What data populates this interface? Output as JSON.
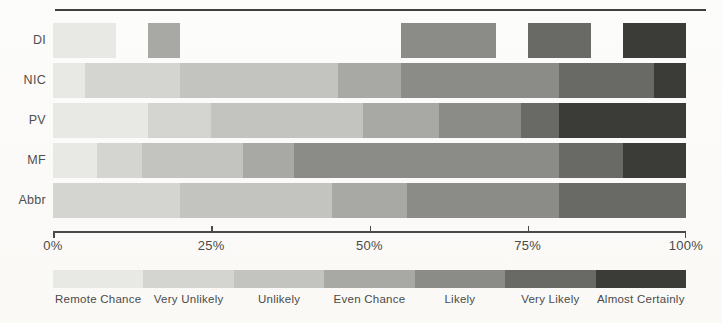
{
  "chart_data": {
    "type": "bar",
    "orientation": "horizontal",
    "stacked": true,
    "unit": "percent",
    "title": "",
    "x_axis": {
      "ticks": [
        "0%",
        "25%",
        "50%",
        "75%",
        "100%"
      ],
      "tick_values": [
        0,
        25,
        50,
        75,
        100
      ],
      "range": [
        0,
        100
      ],
      "grid": false
    },
    "rows": [
      {
        "label": "DI",
        "segments": [
          {
            "term": "Remote Chance",
            "from": 0,
            "to": 10
          },
          {
            "term": "Even Chance",
            "from": 15,
            "to": 20
          },
          {
            "term": "Likely",
            "from": 55,
            "to": 70
          },
          {
            "term": "Very Likely",
            "from": 75,
            "to": 85
          },
          {
            "term": "Almost Certainly",
            "from": 90,
            "to": 100
          }
        ]
      },
      {
        "label": "NIC",
        "segments": [
          {
            "term": "Remote Chance",
            "from": 0,
            "to": 5
          },
          {
            "term": "Very Unlikely",
            "from": 5,
            "to": 20
          },
          {
            "term": "Unlikely",
            "from": 20,
            "to": 45
          },
          {
            "term": "Even Chance",
            "from": 45,
            "to": 55
          },
          {
            "term": "Likely",
            "from": 55,
            "to": 80
          },
          {
            "term": "Very Likely",
            "from": 80,
            "to": 95
          },
          {
            "term": "Almost Certainly",
            "from": 95,
            "to": 100
          }
        ]
      },
      {
        "label": "PV",
        "segments": [
          {
            "term": "Remote Chance",
            "from": 0,
            "to": 15
          },
          {
            "term": "Very Unlikely",
            "from": 15,
            "to": 25
          },
          {
            "term": "Unlikely",
            "from": 25,
            "to": 49
          },
          {
            "term": "Even Chance",
            "from": 49,
            "to": 61
          },
          {
            "term": "Likely",
            "from": 61,
            "to": 74
          },
          {
            "term": "Very Likely",
            "from": 74,
            "to": 80
          },
          {
            "term": "Almost Certainly",
            "from": 80,
            "to": 100
          }
        ]
      },
      {
        "label": "MF",
        "segments": [
          {
            "term": "Remote Chance",
            "from": 0,
            "to": 7
          },
          {
            "term": "Very Unlikely",
            "from": 7,
            "to": 14
          },
          {
            "term": "Unlikely",
            "from": 14,
            "to": 30
          },
          {
            "term": "Even Chance",
            "from": 30,
            "to": 38
          },
          {
            "term": "Likely",
            "from": 38,
            "to": 80
          },
          {
            "term": "Very Likely",
            "from": 80,
            "to": 90
          },
          {
            "term": "Almost Certainly",
            "from": 90,
            "to": 100
          }
        ]
      },
      {
        "label": "Abbr",
        "segments": [
          {
            "term": "Very Unlikely",
            "from": 0,
            "to": 20
          },
          {
            "term": "Unlikely",
            "from": 20,
            "to": 44
          },
          {
            "term": "Even Chance",
            "from": 44,
            "to": 56
          },
          {
            "term": "Likely",
            "from": 56,
            "to": 80
          },
          {
            "term": "Very Likely",
            "from": 80,
            "to": 100
          }
        ]
      }
    ],
    "legend": {
      "position": "bottom",
      "items": [
        {
          "label": "Remote Chance",
          "color": "#e8e8e4"
        },
        {
          "label": "Very Unlikely",
          "color": "#d4d4d0"
        },
        {
          "label": "Unlikely",
          "color": "#c3c3bf"
        },
        {
          "label": "Even Chance",
          "color": "#a8a8a4"
        },
        {
          "label": "Likely",
          "color": "#8b8b87"
        },
        {
          "label": "Very Likely",
          "color": "#696965"
        },
        {
          "label": "Almost Certainly",
          "color": "#3b3b37"
        }
      ]
    },
    "colors": {
      "background": "#fbfaf8",
      "axis": "#4a4a48",
      "text": "#4a4a4a",
      "top_rule": "#3f3f3d"
    }
  }
}
